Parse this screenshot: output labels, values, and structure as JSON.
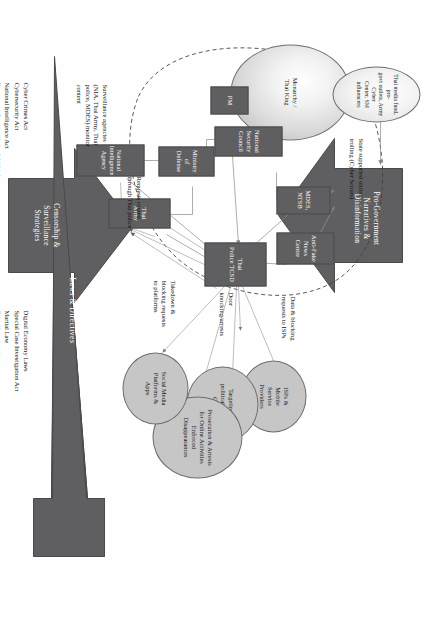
{
  "figure": {
    "colors": {
      "node_fill": "#5f5f61",
      "arrow_fill": "#5f5f61",
      "ellipse_fill": "#c6c6c6",
      "connector": "#8a8a8a",
      "text": "#111111"
    }
  },
  "actors": {
    "monarchy": "Monarchy /\nThai King",
    "media_network": "Thai media fund, pro-\ngovt outlets, Army Cyber\nCenter, SM influencers",
    "pm": "PM",
    "national_security_council": "National Security\nCouncil",
    "ministry_of_defense": "Ministry of\nDefense",
    "national_intelligence_agency": "National\nIntelligence Agency",
    "thai_army": "Thai Army",
    "mdes_ntsb": "MDES, NTSB",
    "anti_fake_news_centre": "Anti-Fake\nNews Centre",
    "thai_police_tcsd": "Thai\nPolice TCSD"
  },
  "targets": [
    {
      "id": "isps",
      "label": "ISPs &\nMobile\nService\nProviders"
    },
    {
      "id": "political-parties",
      "label": "Targeting of\npolitical parties,\nCSOs"
    },
    {
      "id": "prosecution",
      "label": "Prosecution & Arrests\nfor Online Activities\nEnforced\nDisappearances"
    },
    {
      "id": "social-media",
      "label": "Social Media\nPlatforms &\nApps"
    }
  ],
  "edge_labels": {
    "state_trolling": "State supported online\ntrolling (Cyber Scouts)",
    "data_blocking": "Data & blocking\nrequests to ISPs",
    "door_knocking": "Door\nknocking/arrests",
    "takedown": "Takedown &\nblocking requests\nto platforms",
    "requests_routed": "Requests routed\nthrough Thai police",
    "surveillance_agencies": "Surveillance agencies\n(NIA, Thai Army, Thai\npolice, MDES) monitor\ncontent"
  },
  "big_arrows": {
    "top": "Pro-Government\nNarratives &\nDisinformation",
    "bottom": "Censorship &\nSurveillance\nStrategies"
  },
  "laws_band": {
    "title": "Laws & Directives",
    "column_left": "Cyber Crimes Act\nCybersecurity Act\nNational Intelligence Act\nEmergency Decree (Order 26/2014)",
    "column_right": "Digital Economy Laws\nSpecial Case Investigation Act\nMartial Law\nFake News legal actions"
  }
}
